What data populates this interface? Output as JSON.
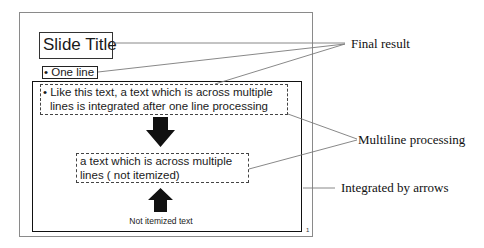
{
  "slide": {
    "title": "Slide Title",
    "one_line": "• One line",
    "multiline_item": [
      "• Like this text, a text which is across multiple",
      "lines is integrated after one line processing"
    ],
    "not_itemized_block": [
      "a text which is across multiple",
      "lines ( not itemized)"
    ],
    "not_itemized_caption": "Not itemized text",
    "page_number": "1"
  },
  "annotations": {
    "final_result": "Final result",
    "multiline_processing": "Multiline processing",
    "integrated_by_arrows": "Integrated by arrows"
  },
  "icons": {
    "down_arrow": "arrow-down-icon",
    "up_arrow": "arrow-up-icon"
  },
  "colors": {
    "line": "#777777",
    "arrow": "#111111",
    "border": "#333333"
  }
}
